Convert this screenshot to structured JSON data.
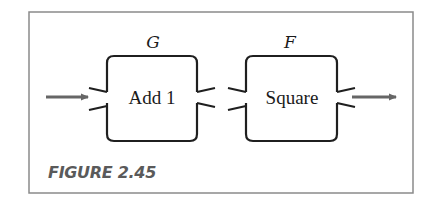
{
  "figure": {
    "caption": "FIGURE 2.45",
    "colors": {
      "frame": "#8a8a8a",
      "box_outline": "#1f1f1f",
      "arrow": "#666666",
      "caption": "#5a5a5a",
      "text": "#1a1a1a"
    },
    "boxes": [
      {
        "name": "G",
        "label": "Add 1"
      },
      {
        "name": "F",
        "label": "Square"
      }
    ],
    "flow": [
      "input",
      "G",
      "F",
      "output"
    ]
  }
}
